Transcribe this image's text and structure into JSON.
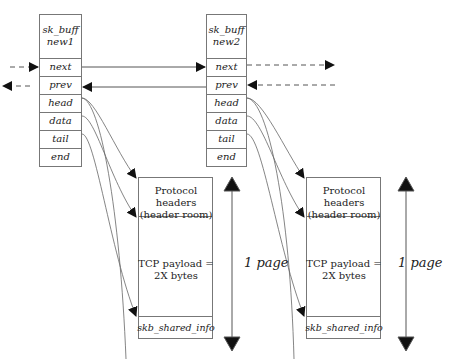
{
  "diagram": {
    "skbs": [
      {
        "title": "sk_buff",
        "name": "new1",
        "fields": [
          "next",
          "prev",
          "head",
          "data",
          "tail",
          "end"
        ]
      },
      {
        "title": "sk_buff",
        "name": "new2",
        "fields": [
          "next",
          "prev",
          "head",
          "data",
          "tail",
          "end"
        ]
      }
    ],
    "buffers": [
      {
        "headers_line1": "Protocol headers",
        "headers_line2": "(header room)",
        "payload_line1": "TCP payload =",
        "payload_line2": "2X bytes",
        "shared_info": "skb_shared_info",
        "size_label": "1 page"
      },
      {
        "headers_line1": "Protocol headers",
        "headers_line2": "(header room)",
        "payload_line1": "TCP payload =",
        "payload_line2": "2X bytes",
        "shared_info": "skb_shared_info",
        "size_label": "1 page"
      }
    ],
    "colors": {
      "line": "#555555",
      "box": "#666666",
      "arrow": "#111111"
    }
  }
}
